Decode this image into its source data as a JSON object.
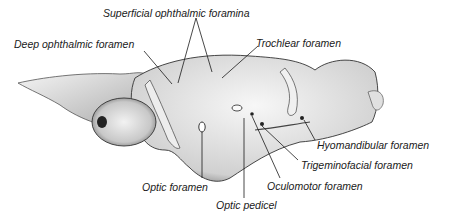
{
  "figure": {
    "labels": [
      {
        "id": "superficial-ophthalmic-foramina",
        "text": "Superficial ophthalmic foramina",
        "x": 103,
        "y": 8
      },
      {
        "id": "deep-ophthalmic-foramen",
        "text": "Deep ophthalmic foramen",
        "x": 14,
        "y": 39
      },
      {
        "id": "trochlear-foramen",
        "text": "Trochlear foramen",
        "x": 256,
        "y": 38
      },
      {
        "id": "hyomandibular-foramen",
        "text": "Hyomandibular foramen",
        "x": 317,
        "y": 140
      },
      {
        "id": "trigeminofacial-foramen",
        "text": "Trigeminofacial foramen",
        "x": 301,
        "y": 160
      },
      {
        "id": "optic-foramen",
        "text": "Optic foramen",
        "x": 142,
        "y": 182
      },
      {
        "id": "oculomotor-foramen",
        "text": "Oculomotor foramen",
        "x": 267,
        "y": 181
      },
      {
        "id": "optic-pedicel",
        "text": "Optic pedicel",
        "x": 216,
        "y": 200
      }
    ],
    "colors": {
      "ink": "#1a1a1a",
      "shade": "#8a8a8a",
      "background": "#ffffff"
    }
  }
}
